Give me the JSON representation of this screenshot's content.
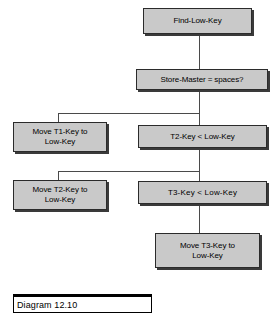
{
  "diagram": {
    "caption": "Diagram 12.10",
    "box_fill_color": "#c9c9c9",
    "box_border_color": "#2b2b2b",
    "shadow_color": "#3a3a3a",
    "connector_color": "#4a4a4a",
    "background_color": "#ffffff",
    "nodes": [
      {
        "id": "find-low-key",
        "label": "Find-Low-Key"
      },
      {
        "id": "store-master",
        "label": "Store-Master = spaces?"
      },
      {
        "id": "move-t1-key",
        "label": "Move T1-Key to\nLow-Key"
      },
      {
        "id": "t2-key-compare",
        "label": "T2-Key < Low-Key"
      },
      {
        "id": "move-t2-key",
        "label": "Move T2-Key to\nLow-Key"
      },
      {
        "id": "t3-key-compare",
        "label": "T3-Key  <  Low-Key"
      },
      {
        "id": "move-t3-key",
        "label": "Move T3-Key to\nLow-Key"
      }
    ]
  }
}
